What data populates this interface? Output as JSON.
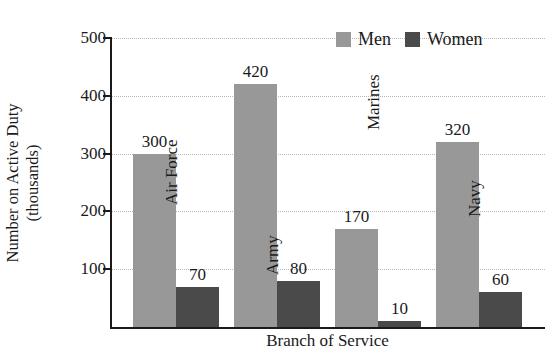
{
  "chart_data": {
    "type": "bar",
    "title": "",
    "xlabel": "Branch of Service",
    "ylabel_line1": "Number on Active Duty",
    "ylabel_line2": "(thousands)",
    "categories": [
      "Air Force",
      "Army",
      "Marines",
      "Navy"
    ],
    "series": [
      {
        "name": "Men",
        "color": "#989898",
        "values": [
          300,
          420,
          170,
          320
        ]
      },
      {
        "name": "Women",
        "color": "#4a4a4a",
        "values": [
          70,
          80,
          10,
          60
        ]
      }
    ],
    "ylim": [
      0,
      500
    ],
    "yticks": [
      100,
      200,
      300,
      400,
      500
    ],
    "ytick_labels": [
      "100",
      "200",
      "300",
      "400",
      "500"
    ],
    "grid": true,
    "grid_style": "dotted",
    "legend_position": "top-right",
    "value_labels": {
      "men": [
        "300",
        "420",
        "170",
        "320"
      ],
      "women": [
        "70",
        "80",
        "10",
        "60"
      ]
    }
  },
  "legend": {
    "items": [
      {
        "label": "Men",
        "swatch": "men"
      },
      {
        "label": "Women",
        "swatch": "women"
      }
    ]
  },
  "axes": {
    "x_title": "Branch of Service",
    "y_title_line1": "Number on Active Duty",
    "y_title_line2": "(thousands)"
  }
}
